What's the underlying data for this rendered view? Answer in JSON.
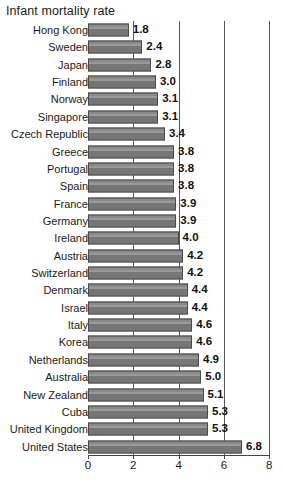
{
  "chart_data": {
    "type": "bar",
    "orientation": "horizontal",
    "title": "Infant mortality rate",
    "xlabel": "",
    "ylabel": "",
    "xlim": [
      0,
      8
    ],
    "xticks": [
      "0",
      "2",
      "4",
      "6",
      "8"
    ],
    "xtick_values": [
      0,
      2,
      4,
      6,
      8
    ],
    "grid": "vertical",
    "legend": "none",
    "bar_color": "#7a7a7a",
    "bar_border_color": "#4a4a4a",
    "gridline_color": "#555555",
    "axis_color": "#444444",
    "text_color": "#1a1a1a",
    "categories": [
      "Hong Kong",
      "Sweden",
      "Japan",
      "Finland",
      "Norway",
      "Singapore",
      "Czech Republic",
      "Greece",
      "Portugal",
      "Spain",
      "France",
      "Germany",
      "Ireland",
      "Austria",
      "Switzerland",
      "Denmark",
      "Israel",
      "Italy",
      "Korea",
      "Netherlands",
      "Australia",
      "New Zealand",
      "Cuba",
      "United Kingdom",
      "United States"
    ],
    "values": [
      1.8,
      2.4,
      2.8,
      3.0,
      3.1,
      3.1,
      3.4,
      3.8,
      3.8,
      3.8,
      3.9,
      3.9,
      4.0,
      4.2,
      4.2,
      4.4,
      4.4,
      4.6,
      4.6,
      4.9,
      5.0,
      5.1,
      5.3,
      5.3,
      6.8
    ],
    "value_labels": [
      "1.8",
      "2.4",
      "2.8",
      "3.0",
      "3.1",
      "3.1",
      "3.4",
      "3.8",
      "3.8",
      "3.8",
      "3.9",
      "3.9",
      "4.0",
      "4.2",
      "4.2",
      "4.4",
      "4.4",
      "4.6",
      "4.6",
      "4.9",
      "5.0",
      "5.1",
      "5.3",
      "5.3",
      "6.8"
    ]
  }
}
